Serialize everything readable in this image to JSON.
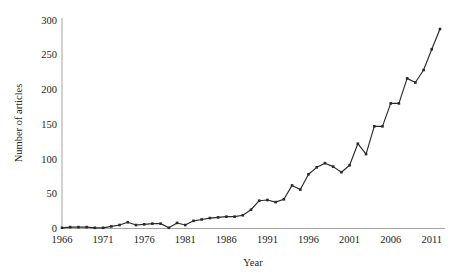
{
  "chart_data": {
    "type": "line",
    "title": "",
    "xlabel": "Year",
    "ylabel": "Number of articles",
    "xlim": [
      1966,
      2012
    ],
    "ylim": [
      0,
      300
    ],
    "grid": false,
    "legend": null,
    "x_tick_labels": [
      "1966",
      "1971",
      "1976",
      "1981",
      "1986",
      "1991",
      "1996",
      "2001",
      "2006",
      "2011"
    ],
    "x_tick_values": [
      1966,
      1971,
      1976,
      1981,
      1986,
      1991,
      1996,
      2001,
      2006,
      2011
    ],
    "y_tick_labels": [
      "0",
      "50",
      "100",
      "150",
      "200",
      "250",
      "300"
    ],
    "y_tick_values": [
      0,
      50,
      100,
      150,
      200,
      250,
      300
    ],
    "marker": "square",
    "line_color": "#2a2a2a",
    "x": [
      1966,
      1967,
      1968,
      1969,
      1970,
      1971,
      1972,
      1973,
      1974,
      1975,
      1976,
      1977,
      1978,
      1979,
      1980,
      1981,
      1982,
      1983,
      1984,
      1985,
      1986,
      1987,
      1988,
      1989,
      1990,
      1991,
      1992,
      1993,
      1994,
      1995,
      1996,
      1997,
      1998,
      1999,
      2000,
      2001,
      2002,
      2003,
      2004,
      2005,
      2006,
      2007,
      2008,
      2009,
      2010,
      2011,
      2012
    ],
    "values": [
      1,
      2,
      2,
      2,
      1,
      1,
      3,
      5,
      9,
      5,
      6,
      7,
      7,
      1,
      8,
      5,
      11,
      13,
      15,
      16,
      17,
      17,
      19,
      27,
      40,
      41,
      38,
      42,
      62,
      56,
      78,
      88,
      94,
      89,
      81,
      91,
      122,
      107,
      147,
      147,
      180,
      180,
      216,
      210,
      228,
      258,
      287
    ],
    "series": [
      {
        "name": "Number of articles",
        "values": [
          1,
          2,
          2,
          2,
          1,
          1,
          3,
          5,
          9,
          5,
          6,
          7,
          7,
          1,
          8,
          5,
          11,
          13,
          15,
          16,
          17,
          17,
          19,
          27,
          40,
          41,
          38,
          42,
          62,
          56,
          78,
          88,
          94,
          89,
          81,
          91,
          122,
          107,
          147,
          147,
          180,
          180,
          216,
          210,
          228,
          258,
          287
        ]
      }
    ]
  }
}
